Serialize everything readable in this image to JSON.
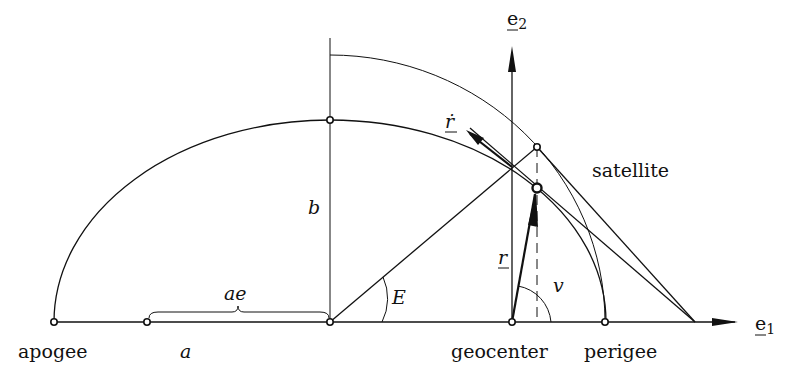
{
  "diagram": {
    "labels": {
      "apogee": "apogee",
      "perigee": "perigee",
      "geocenter": "geocenter",
      "satellite": "satellite",
      "semi_major_axis": "a",
      "semi_minor_axis": "b",
      "focal_offset": "ae",
      "eccentric_anomaly": "E",
      "true_anomaly": "v",
      "position_vector": "r",
      "velocity_vector": "ṙ",
      "axis_e1": "e",
      "axis_e1_sub": "1",
      "axis_e2": "e",
      "axis_e2_sub": "2"
    },
    "nodes": [
      {
        "id": "apogee",
        "x": 54,
        "y": 322
      },
      {
        "id": "ae-start",
        "x": 147,
        "y": 322
      },
      {
        "id": "ellipse-center",
        "x": 330,
        "y": 322
      },
      {
        "id": "geocenter",
        "x": 512,
        "y": 322
      },
      {
        "id": "perigee",
        "x": 605,
        "y": 322
      },
      {
        "id": "ellipse-top",
        "x": 330,
        "y": 120
      },
      {
        "id": "satellite-on-circle",
        "x": 537,
        "y": 147
      },
      {
        "id": "satellite",
        "x": 537,
        "y": 188
      },
      {
        "id": "tangent-meet",
        "x": 695,
        "y": 322
      }
    ],
    "edges": [
      {
        "from": "apogee",
        "to": "e1-axis",
        "label": "baseline / e1 axis"
      },
      {
        "from": "ellipse-center",
        "to": "satellite-on-circle",
        "label": "E"
      },
      {
        "from": "geocenter",
        "to": "satellite",
        "label": "r"
      },
      {
        "from": "satellite-on-circle",
        "to": "tangent-meet",
        "label": "circle tangent"
      },
      {
        "from": "satellite",
        "to": "tangent-meet",
        "label": "ellipse tangent"
      }
    ]
  }
}
